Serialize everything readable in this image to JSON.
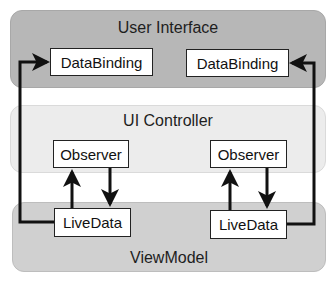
{
  "diagram": {
    "layers": {
      "user_interface": {
        "title": "User Interface"
      },
      "ui_controller": {
        "title": "UI Controller"
      },
      "view_model": {
        "title": "ViewModel"
      }
    },
    "nodes": {
      "databinding_left": "DataBinding",
      "databinding_right": "DataBinding",
      "observer_left": "Observer",
      "observer_right": "Observer",
      "livedata_left": "LiveData",
      "livedata_right": "LiveData"
    },
    "edges": [
      {
        "from": "livedata_left",
        "to": "databinding_left"
      },
      {
        "from": "livedata_right",
        "to": "databinding_right"
      },
      {
        "from": "livedata_left",
        "to": "observer_left"
      },
      {
        "from": "observer_left",
        "to": "livedata_left"
      },
      {
        "from": "livedata_right",
        "to": "observer_right"
      },
      {
        "from": "observer_right",
        "to": "livedata_right"
      }
    ],
    "colors": {
      "user_interface_bg": "#b7b7b7",
      "ui_controller_bg": "#ececec",
      "view_model_bg": "#d0d0d0",
      "line": "#111111"
    }
  }
}
